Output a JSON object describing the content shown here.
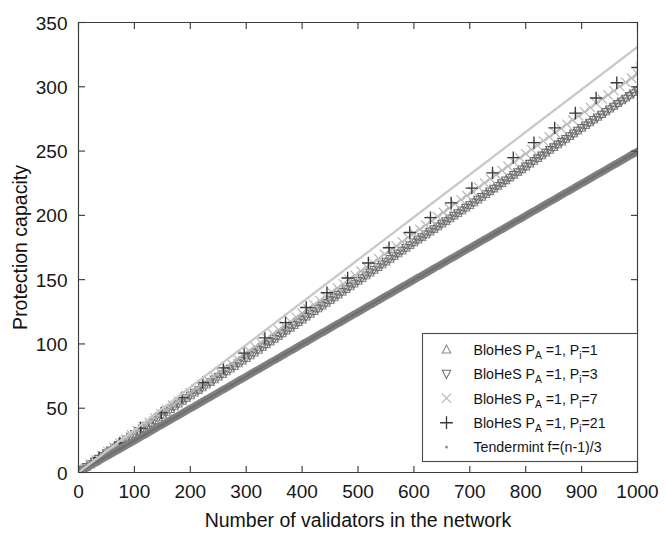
{
  "chart_data": {
    "type": "line",
    "title": "",
    "xlabel": "Number of validators in the network",
    "ylabel": "Protection capacity",
    "xlim": [
      0,
      1000
    ],
    "ylim": [
      0,
      350
    ],
    "xticks": [
      0,
      100,
      200,
      300,
      400,
      500,
      600,
      700,
      800,
      900,
      1000
    ],
    "yticks": [
      0,
      50,
      100,
      150,
      200,
      250,
      300,
      350
    ],
    "grid": false,
    "legend_position": "lower-right",
    "series": [
      {
        "name": "BloHeS P_A =1, P_i =1",
        "label_main": "BloHeS P",
        "label_sub_a": "A",
        "label_mid": " =1, P",
        "label_sub_i": "i",
        "label_tail": "=1",
        "marker": "triangle-up",
        "color": "#8a8a8a",
        "x": [
          0,
          100,
          200,
          300,
          400,
          500,
          600,
          700,
          800,
          900,
          1000
        ],
        "values": [
          0,
          30,
          60,
          89,
          119,
          149,
          179,
          208,
          238,
          268,
          298
        ]
      },
      {
        "name": "BloHeS P_A =1, P_i =3",
        "label_main": "BloHeS P",
        "label_sub_a": "A",
        "label_mid": " =1, P",
        "label_sub_i": "i",
        "label_tail": "=3",
        "marker": "triangle-down",
        "color": "#6e6e6e",
        "x": [
          0,
          100,
          200,
          300,
          400,
          500,
          600,
          700,
          800,
          900,
          1000
        ],
        "values": [
          0,
          30,
          60,
          89,
          119,
          149,
          179,
          208,
          238,
          268,
          297
        ]
      },
      {
        "name": "BloHeS P_A =1, P_i =7",
        "label_main": "BloHeS P",
        "label_sub_a": "A",
        "label_mid": " =1, P",
        "label_sub_i": "i",
        "label_tail": "=7",
        "marker": "cross-x",
        "color": "#b4b4b4",
        "x": [
          0,
          100,
          200,
          300,
          400,
          500,
          600,
          700,
          800,
          900,
          1000
        ],
        "values": [
          0,
          31,
          62,
          93,
          124,
          155,
          186,
          217,
          248,
          279,
          310
        ]
      },
      {
        "name": "BloHeS P_A =1, P_i =21",
        "label_main": "BloHeS P",
        "label_sub_a": "A",
        "label_mid": " =1, P",
        "label_sub_i": "i",
        "label_tail": "=21",
        "marker": "plus",
        "color": "#3a3a3a",
        "x": [
          0,
          100,
          200,
          300,
          400,
          500,
          600,
          700,
          800,
          900,
          1000
        ],
        "values": [
          0,
          31,
          63,
          94,
          126,
          157,
          189,
          220,
          252,
          283,
          315
        ]
      },
      {
        "name": "Tendermint f=(n-1)/3",
        "label_main": "Tendermint f=(n-1)/3",
        "label_sub_a": "",
        "label_mid": "",
        "label_sub_i": "",
        "label_tail": "",
        "marker": "dot",
        "color": "#808080",
        "x": [
          0,
          100,
          200,
          300,
          400,
          500,
          600,
          700,
          800,
          900,
          1000
        ],
        "values": [
          0,
          24.7,
          49.7,
          74.7,
          99.7,
          124.7,
          149.7,
          174.7,
          199.7,
          224.7,
          249.7
        ]
      },
      {
        "name": "upper envelope",
        "label_main": "",
        "label_sub_a": "",
        "label_mid": "",
        "label_sub_i": "",
        "label_tail": "",
        "marker": "none",
        "color": "#c8c8c8",
        "x": [
          0,
          1000
        ],
        "values": [
          0,
          331
        ]
      }
    ]
  },
  "axes": {
    "xlabel": "Number of validators in the network",
    "ylabel": "Protection capacity",
    "xtick_labels": [
      "0",
      "100",
      "200",
      "300",
      "400",
      "500",
      "600",
      "700",
      "800",
      "900",
      "1000"
    ],
    "ytick_labels": [
      "0",
      "50",
      "100",
      "150",
      "200",
      "250",
      "300",
      "350"
    ]
  },
  "legend": {
    "items": [
      {
        "marker": "triangle-up",
        "main": "BloHeS P",
        "sub_a": "A",
        "mid": " =1, P",
        "sub_i": "i",
        "tail": "=1",
        "color": "#8a8a8a"
      },
      {
        "marker": "triangle-down",
        "main": "BloHeS P",
        "sub_a": "A",
        "mid": " =1, P",
        "sub_i": "i",
        "tail": "=3",
        "color": "#6e6e6e"
      },
      {
        "marker": "cross-x",
        "main": "BloHeS P",
        "sub_a": "A",
        "mid": " =1, P",
        "sub_i": "i",
        "tail": "=7",
        "color": "#b4b4b4"
      },
      {
        "marker": "plus",
        "main": "BloHeS P",
        "sub_a": "A",
        "mid": " =1, P",
        "sub_i": "i",
        "tail": "=21",
        "color": "#3a3a3a"
      },
      {
        "marker": "dot",
        "main": "Tendermint f=(n-1)/3",
        "sub_a": "",
        "mid": "",
        "sub_i": "",
        "tail": "",
        "color": "#909090"
      }
    ]
  }
}
